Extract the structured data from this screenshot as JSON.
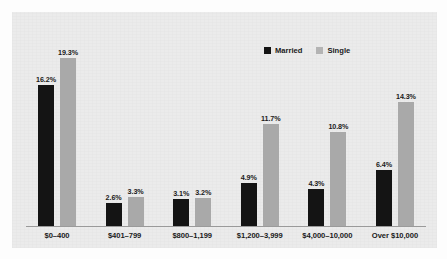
{
  "chart_data": {
    "type": "bar",
    "title": "",
    "subtitle": "",
    "xlabel": "",
    "ylabel": "",
    "grid": false,
    "legend_position": "top-right",
    "ylim": [
      0,
      19.3
    ],
    "value_suffix": "%",
    "categories": [
      "$0–400",
      "$401–799",
      "$800–1,199",
      "$1,200–3,999",
      "$4,000–10,000",
      "Over $10,000"
    ],
    "series": [
      {
        "name": "Married",
        "color": "#141414",
        "values": [
          16.2,
          2.6,
          3.1,
          4.9,
          4.3,
          6.4
        ],
        "labels": [
          "16.2%",
          "2.6%",
          "3.1%",
          "4.9%",
          "4.3%",
          "6.4%"
        ]
      },
      {
        "name": "Single",
        "color": "#a9a9a9",
        "values": [
          19.3,
          3.3,
          3.2,
          11.7,
          10.8,
          14.3
        ],
        "labels": [
          "19.3%",
          "3.3%",
          "3.2%",
          "11.7%",
          "10.8%",
          "14.3%"
        ]
      }
    ]
  },
  "legend": {
    "items": [
      {
        "label": "Married",
        "swatch": "married-swatch"
      },
      {
        "label": "Single",
        "swatch": "single-swatch"
      }
    ]
  },
  "colors": {
    "married": "#141414",
    "single": "#a9a9a9",
    "panel_background": "#ebebeb",
    "axis_line": "#9a9a9a",
    "page_background": "#fdfdfd",
    "text": "#1a1a1a"
  }
}
